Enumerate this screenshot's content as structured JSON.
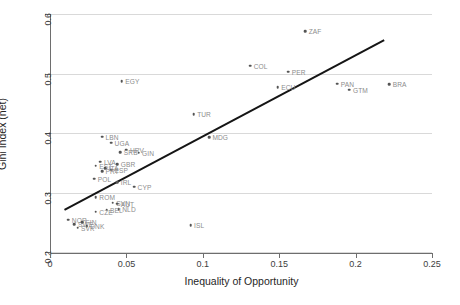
{
  "chart_data": {
    "type": "scatter",
    "title": "",
    "xlabel": "Inequality of Opportunity",
    "ylabel": "Gini Index (net)",
    "xlim": [
      0,
      0.25
    ],
    "ylim": [
      0.2,
      0.6
    ],
    "xticks": [
      "0",
      "0.05",
      "0.1",
      "0.15",
      "0.2",
      "0.25"
    ],
    "xtick_values": [
      0,
      0.05,
      0.1,
      0.15,
      0.2,
      0.25
    ],
    "yticks": [
      "0.2",
      "0.3",
      "0.4",
      "0.5",
      "0.6"
    ],
    "ytick_values": [
      0.2,
      0.3,
      0.4,
      0.5,
      0.6
    ],
    "grid": "horizontal",
    "legend": "none",
    "marker_color": "#545454",
    "label_color": "#8c8c8c",
    "fit_color": "#151515",
    "fit_line": {
      "x0": 0.009,
      "y0": 0.272,
      "x1": 0.218,
      "y1": 0.557
    },
    "points": [
      {
        "label": "ZAF",
        "x": 0.167,
        "y": 0.571
      },
      {
        "label": "COL",
        "x": 0.131,
        "y": 0.513
      },
      {
        "label": "PER",
        "x": 0.156,
        "y": 0.503
      },
      {
        "label": "ECU",
        "x": 0.149,
        "y": 0.477
      },
      {
        "label": "PAN",
        "x": 0.188,
        "y": 0.483
      },
      {
        "label": "GTM",
        "x": 0.196,
        "y": 0.473
      },
      {
        "label": "BRA",
        "x": 0.222,
        "y": 0.482
      },
      {
        "label": "EGY",
        "x": 0.047,
        "y": 0.487
      },
      {
        "label": "TUR",
        "x": 0.094,
        "y": 0.432
      },
      {
        "label": "MDG",
        "x": 0.104,
        "y": 0.393
      },
      {
        "label": "ISL",
        "x": 0.092,
        "y": 0.245
      },
      {
        "label": "LBN",
        "x": 0.034,
        "y": 0.394
      },
      {
        "label": "UGA",
        "x": 0.04,
        "y": 0.384
      },
      {
        "label": "HRV",
        "x": 0.05,
        "y": 0.372
      },
      {
        "label": "GIN",
        "x": 0.058,
        "y": 0.367
      },
      {
        "label": "SRB",
        "x": 0.046,
        "y": 0.368
      },
      {
        "label": "LVA",
        "x": 0.033,
        "y": 0.352
      },
      {
        "label": "GBR",
        "x": 0.044,
        "y": 0.348
      },
      {
        "label": "EST",
        "x": 0.03,
        "y": 0.345
      },
      {
        "label": "ITA",
        "x": 0.036,
        "y": 0.341
      },
      {
        "label": "ESP",
        "x": 0.04,
        "y": 0.338
      },
      {
        "label": "PRT",
        "x": 0.034,
        "y": 0.336
      },
      {
        "label": "POL",
        "x": 0.029,
        "y": 0.323
      },
      {
        "label": "IRL",
        "x": 0.044,
        "y": 0.317
      },
      {
        "label": "CYP",
        "x": 0.055,
        "y": 0.31
      },
      {
        "label": "ROM",
        "x": 0.03,
        "y": 0.292
      },
      {
        "label": "SVN",
        "x": 0.041,
        "y": 0.283
      },
      {
        "label": "AUT",
        "x": 0.044,
        "y": 0.281
      },
      {
        "label": "NLD",
        "x": 0.045,
        "y": 0.272
      },
      {
        "label": "BEL",
        "x": 0.037,
        "y": 0.271
      },
      {
        "label": "CZE",
        "x": 0.03,
        "y": 0.268
      },
      {
        "label": "NOR",
        "x": 0.012,
        "y": 0.254
      },
      {
        "label": "SWE",
        "x": 0.016,
        "y": 0.247
      },
      {
        "label": "FIN",
        "x": 0.021,
        "y": 0.25
      },
      {
        "label": "DNK",
        "x": 0.024,
        "y": 0.243
      },
      {
        "label": "SVK",
        "x": 0.018,
        "y": 0.241
      }
    ]
  }
}
